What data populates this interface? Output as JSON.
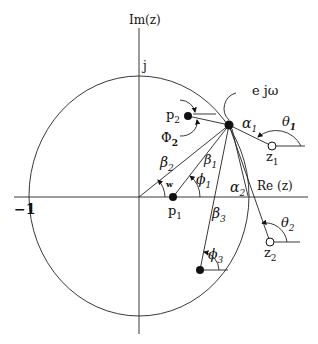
{
  "labels": {
    "im_axis": "Im(z)",
    "re_axis": "Re (z)",
    "j": "j",
    "minus_one": "−1",
    "ejw": "e jω",
    "p1": "p",
    "p1_sub": "1",
    "p2": "p",
    "p2_sub": "2",
    "z1": "z",
    "z1_sub": "1",
    "z2": "z",
    "z2_sub": "2",
    "alpha1": "α",
    "alpha1_sub": "1",
    "alpha2": "α",
    "alpha2_sub": "2",
    "beta1": "β",
    "beta1_sub": "1",
    "beta2": "β",
    "beta2_sub": "2",
    "beta3": "β",
    "beta3_sub": "3",
    "phi1": "ϕ",
    "phi1_sub": "1",
    "Phi2": "Φ",
    "Phi2_sub": "2",
    "phi3": "ϕ",
    "phi3_sub": "3",
    "theta1": "θ",
    "theta1_sub": "1",
    "theta2": "θ",
    "theta2_sub": "2",
    "w": "w"
  }
}
